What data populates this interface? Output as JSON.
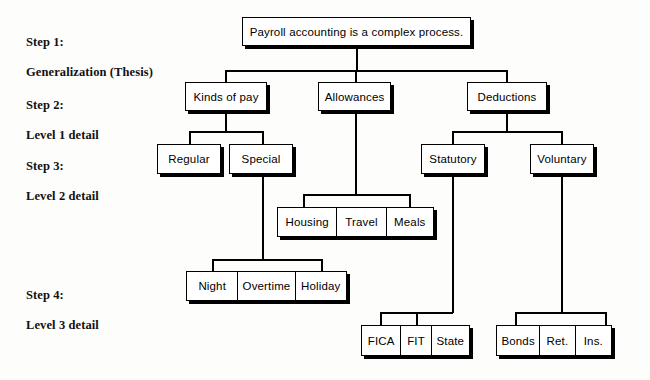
{
  "diagram": {
    "title_text": "Payroll accounting is a complex process.",
    "steps": [
      {
        "id": "step-1",
        "line1": "Step 1:",
        "line2": "Generalization (Thesis)"
      },
      {
        "id": "step-2",
        "line1": "Step 2:",
        "line2": "Level 1 detail"
      },
      {
        "id": "step-3",
        "line1": "Step 3:",
        "line2": "Level 2 detail"
      },
      {
        "id": "step-4",
        "line1": "Step 4:",
        "line2": "Level 3 detail"
      }
    ],
    "level1": [
      {
        "id": "kinds-of-pay",
        "label": "Kinds of pay"
      },
      {
        "id": "allowances",
        "label": "Allowances"
      },
      {
        "id": "deductions",
        "label": "Deductions"
      }
    ],
    "level2": [
      {
        "id": "regular",
        "label": "Regular"
      },
      {
        "id": "special",
        "label": "Special"
      },
      {
        "id": "statutory",
        "label": "Statutory"
      },
      {
        "id": "voluntary",
        "label": "Voluntary"
      }
    ],
    "allowance_items": [
      {
        "id": "housing",
        "label": "Housing"
      },
      {
        "id": "travel",
        "label": "Travel"
      },
      {
        "id": "meals",
        "label": "Meals"
      }
    ],
    "special_pay_items": [
      {
        "id": "night",
        "label": "Night"
      },
      {
        "id": "overtime",
        "label": "Overtime"
      },
      {
        "id": "holiday",
        "label": "Holiday"
      }
    ],
    "statutory_items": [
      {
        "id": "fica",
        "label": "FICA"
      },
      {
        "id": "fit",
        "label": "FIT"
      },
      {
        "id": "state",
        "label": "State"
      }
    ],
    "voluntary_items": [
      {
        "id": "bonds",
        "label": "Bonds"
      },
      {
        "id": "retirement",
        "label": "Ret."
      },
      {
        "id": "insurance",
        "label": "Ins."
      }
    ],
    "colors": {
      "ink": "#000000",
      "paper": "#fdfdfc"
    }
  }
}
